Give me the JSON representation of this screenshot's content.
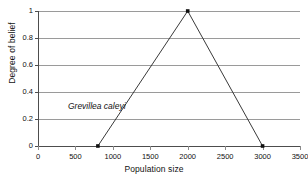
{
  "chart_data": {
    "type": "line",
    "title": "",
    "subtitle": "",
    "xlabel": "Population size",
    "ylabel": "Degree of belief",
    "xlim": [
      0,
      3500
    ],
    "ylim": [
      0,
      1
    ],
    "xticks": [
      0,
      500,
      1000,
      1500,
      2000,
      2500,
      3000,
      3500
    ],
    "xtick_labels": [
      "0",
      "500",
      "1000",
      "1500",
      "2000",
      "2500",
      "3000",
      "3500"
    ],
    "yticks": [
      0,
      0.2,
      0.4,
      0.6,
      0.8,
      1
    ],
    "ytick_labels": [
      "0",
      "0.2",
      "0.4",
      "0.6",
      "0.8",
      "1"
    ],
    "grid": "horizontal",
    "legend": "none",
    "markers": true,
    "series": [
      {
        "name": "Grevillea caleyi degree of belief",
        "x": [
          800,
          2000,
          3000
        ],
        "y": [
          0,
          1,
          0
        ]
      }
    ],
    "annotations": [
      {
        "text": "Grevillea caleyi",
        "x": 400,
        "y": 0.3,
        "style": "italic"
      }
    ],
    "colors": {
      "line": "#3a3a3a",
      "marker": "#111111",
      "grid": "#9a9a9a",
      "axis": "#4d4d4d",
      "background": "#ffffff"
    }
  }
}
